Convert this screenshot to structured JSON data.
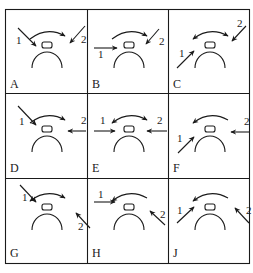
{
  "figure": {
    "colors": {
      "ink": "#1a1a1a",
      "background": "#ffffff"
    },
    "panels": [
      {
        "id": "A",
        "label": "A",
        "curve": "right",
        "arrow1": {
          "label": "1",
          "from": [
            12,
            18
          ],
          "to": [
            30,
            36
          ],
          "label_pos": [
            10,
            34
          ]
        },
        "arrow2": {
          "label": "2",
          "from": [
            79,
            16
          ],
          "to": [
            64,
            33
          ],
          "label_pos": [
            75,
            33
          ]
        }
      },
      {
        "id": "B",
        "label": "B",
        "curve": "right",
        "arrow1": {
          "label": "1",
          "from": [
            6,
            38
          ],
          "to": [
            29,
            38
          ],
          "label_pos": [
            10,
            48
          ]
        },
        "arrow2": {
          "label": "2",
          "from": [
            71,
            19
          ],
          "to": [
            58,
            34
          ],
          "label_pos": [
            71,
            35
          ]
        }
      },
      {
        "id": "C",
        "label": "C",
        "curve": "both",
        "arrow1": {
          "label": "1",
          "from": [
            8,
            58
          ],
          "to": [
            25,
            41
          ],
          "label_pos": [
            10,
            47
          ]
        },
        "arrow2": {
          "label": "2",
          "from": [
            77,
            16
          ],
          "to": [
            63,
            31
          ],
          "label_pos": [
            68,
            17
          ]
        }
      },
      {
        "id": "D",
        "label": "D",
        "curve": "right",
        "arrow1": {
          "label": "1",
          "from": [
            12,
            12
          ],
          "to": [
            30,
            31
          ],
          "label_pos": [
            13,
            31
          ]
        },
        "arrow2": {
          "label": "2",
          "from": [
            80,
            37
          ],
          "to": [
            62,
            37
          ],
          "label_pos": [
            75,
            30
          ]
        }
      },
      {
        "id": "E",
        "label": "E",
        "curve": "both",
        "arrow1": {
          "label": "1",
          "from": [
            6,
            37
          ],
          "to": [
            27,
            37
          ],
          "label_pos": [
            12,
            30
          ]
        },
        "arrow2": {
          "label": "2",
          "from": [
            79,
            37
          ],
          "to": [
            59,
            37
          ],
          "label_pos": [
            69,
            30
          ]
        }
      },
      {
        "id": "F",
        "label": "F",
        "curve": "left",
        "arrow1": {
          "label": "1",
          "from": [
            9,
            59
          ],
          "to": [
            25,
            43
          ],
          "label_pos": [
            8,
            48
          ]
        },
        "arrow2": {
          "label": "2",
          "from": [
            80,
            38
          ],
          "to": [
            62,
            38
          ],
          "label_pos": [
            75,
            31
          ]
        }
      },
      {
        "id": "G",
        "label": "G",
        "curve": "both",
        "arrow1": {
          "label": "1",
          "from": [
            14,
            13
          ],
          "to": [
            30,
            30
          ],
          "label_pos": [
            16,
            29
          ]
        },
        "arrow2": {
          "label": "2",
          "from": [
            84,
            56
          ],
          "to": [
            70,
            41
          ],
          "label_pos": [
            72,
            58
          ]
        }
      },
      {
        "id": "H",
        "label": "H",
        "curve": "left",
        "arrow1": {
          "label": "1",
          "from": [
            6,
            30
          ],
          "to": [
            27,
            30
          ],
          "label_pos": [
            10,
            26
          ]
        },
        "arrow2": {
          "label": "2",
          "from": [
            77,
            53
          ],
          "to": [
            62,
            39
          ],
          "label_pos": [
            72,
            46
          ]
        }
      },
      {
        "id": "J",
        "label": "J",
        "curve": "left",
        "arrow1": {
          "label": "1",
          "from": [
            8,
            51
          ],
          "to": [
            25,
            35
          ],
          "label_pos": [
            8,
            42
          ]
        },
        "arrow2": {
          "label": "2",
          "from": [
            80,
            51
          ],
          "to": [
            66,
            36
          ],
          "label_pos": [
            77,
            42
          ]
        }
      }
    ]
  }
}
